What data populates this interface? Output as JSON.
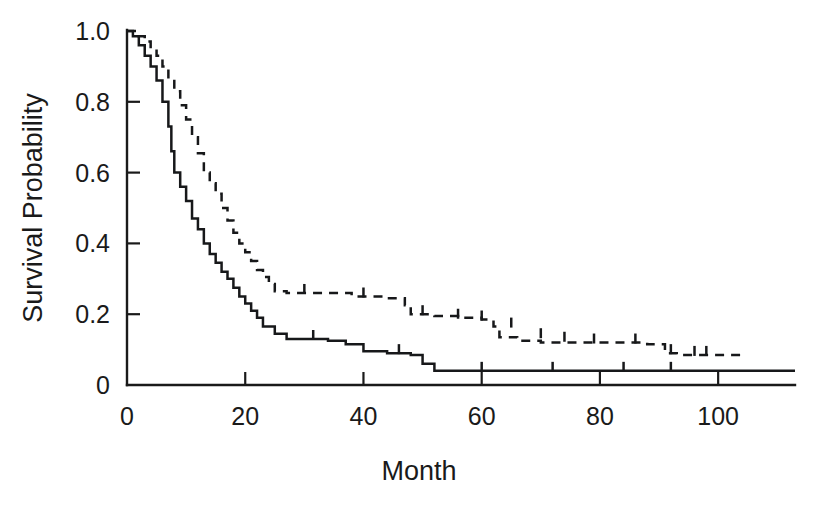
{
  "figure": {
    "background_color": "#ffffff",
    "ink_color": "#17181a"
  },
  "chart_data": {
    "type": "line",
    "title": "",
    "subtitle": "",
    "xlabel": "Month",
    "ylabel": "Survival Probability",
    "xlim": [
      0,
      113
    ],
    "ylim": [
      0,
      1.0
    ],
    "xticks": [
      0,
      20,
      40,
      60,
      80,
      100
    ],
    "xtick_labels": [
      "0",
      "20",
      "40",
      "60",
      "80",
      "100"
    ],
    "yticks": [
      0,
      0.2,
      0.4,
      0.6,
      0.8,
      1.0
    ],
    "ytick_labels": [
      "0",
      "0.2",
      "0.4",
      "0.6",
      "0.8",
      "1.0"
    ],
    "grid": false,
    "legend_position": "none",
    "step_style": "post",
    "annotations": [],
    "series": [
      {
        "name": "Group 1",
        "line_style": "solid",
        "color": "#17181a",
        "x": [
          0,
          1,
          2,
          3,
          4,
          5,
          6,
          7,
          7.5,
          8,
          9,
          10,
          11,
          12,
          13,
          14,
          15,
          16,
          17,
          18,
          19,
          20,
          21,
          22,
          23,
          25,
          27,
          30,
          34,
          37,
          40,
          44,
          48,
          50,
          52,
          113
        ],
        "y": [
          1.0,
          0.985,
          0.96,
          0.93,
          0.9,
          0.86,
          0.8,
          0.73,
          0.66,
          0.6,
          0.56,
          0.52,
          0.47,
          0.44,
          0.4,
          0.37,
          0.345,
          0.32,
          0.3,
          0.275,
          0.25,
          0.23,
          0.21,
          0.19,
          0.165,
          0.145,
          0.13,
          0.13,
          0.125,
          0.115,
          0.095,
          0.09,
          0.085,
          0.06,
          0.04,
          0.04
        ],
        "censor_x": [
          31.5,
          46,
          60,
          72,
          84,
          92
        ],
        "censor_y": [
          0.13,
          0.09,
          0.04,
          0.04,
          0.04,
          0.04
        ]
      },
      {
        "name": "Group 2",
        "line_style": "dashed",
        "color": "#17181a",
        "x": [
          0,
          2,
          3,
          4,
          5,
          6,
          7,
          8,
          9,
          10,
          11,
          12,
          13,
          14,
          15,
          16,
          17,
          18,
          19,
          20,
          21,
          22,
          23,
          24,
          25,
          27,
          32,
          38,
          41,
          44,
          47,
          48,
          52,
          56,
          60,
          62,
          63,
          66,
          70,
          76,
          82,
          88,
          91,
          93,
          100,
          104
        ],
        "y": [
          1.0,
          0.985,
          0.97,
          0.95,
          0.93,
          0.9,
          0.865,
          0.83,
          0.79,
          0.75,
          0.7,
          0.655,
          0.6,
          0.57,
          0.54,
          0.5,
          0.465,
          0.43,
          0.4,
          0.375,
          0.35,
          0.325,
          0.305,
          0.285,
          0.265,
          0.26,
          0.26,
          0.25,
          0.25,
          0.245,
          0.225,
          0.2,
          0.195,
          0.19,
          0.185,
          0.165,
          0.135,
          0.125,
          0.12,
          0.12,
          0.12,
          0.115,
          0.09,
          0.085,
          0.085,
          0.085
        ],
        "censor_x": [
          30,
          40,
          50,
          56,
          60,
          65,
          70,
          74,
          79,
          86,
          92,
          96,
          98
        ],
        "censor_y": [
          0.26,
          0.25,
          0.2,
          0.19,
          0.185,
          0.165,
          0.135,
          0.125,
          0.12,
          0.12,
          0.09,
          0.085,
          0.085
        ]
      }
    ]
  }
}
